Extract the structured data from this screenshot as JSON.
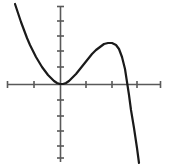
{
  "figure": {
    "title": "",
    "background_color": "#ffffff"
  },
  "chart_data": {
    "type": "line",
    "title": "",
    "subtitle": "",
    "xlabel": "",
    "ylabel": "",
    "grid": false,
    "legend": null,
    "axes": {
      "x_axis": {
        "color": "#595959",
        "line_width": 1.6,
        "pixel_y": 84,
        "pixel_x_start": 7,
        "pixel_x_end": 161,
        "range": [
          -2.05,
          3.9
        ],
        "tick_values": [
          -1,
          1,
          2,
          3
        ],
        "tick_labels": [
          "",
          "",
          "",
          ""
        ],
        "tick_pixels": [
          34,
          86,
          112,
          137
        ],
        "tick_length": 7
      },
      "y_axis": {
        "color": "#595959",
        "line_width": 1.6,
        "pixel_x": 60,
        "pixel_y_start": 6,
        "pixel_y_end": 162,
        "range": [
          -5.2,
          5.2
        ],
        "tick_values": [
          4,
          3,
          2,
          1,
          -1,
          -2,
          -3,
          -4,
          -5
        ],
        "tick_labels": [
          "",
          "",
          "",
          "",
          "",
          "",
          "",
          "",
          ""
        ],
        "tick_pixels": [
          21,
          36,
          51,
          67,
          100,
          116,
          131,
          146,
          158
        ],
        "tick_length": 7
      }
    },
    "curve": {
      "name": "polynomial-curve",
      "color": "#1a1a1a",
      "line_width": 2.2,
      "style": "solid",
      "features": {
        "tangential_minimum": {
          "x": 0,
          "y": 0,
          "pixel": [
            60,
            84
          ]
        },
        "local_maximum": {
          "x": 1.95,
          "y": 1.38,
          "pixel": [
            111,
            43
          ]
        },
        "x_intercept_right": {
          "x": 2.55,
          "y": 0,
          "pixel": [
            127,
            84
          ]
        }
      },
      "points_pixel": [
        [
          15,
          4
        ],
        [
          18,
          13
        ],
        [
          21,
          22
        ],
        [
          24,
          30
        ],
        [
          27,
          38
        ],
        [
          30,
          45
        ],
        [
          33,
          51
        ],
        [
          36,
          57
        ],
        [
          39,
          62
        ],
        [
          42,
          67
        ],
        [
          45,
          71
        ],
        [
          48,
          75
        ],
        [
          51,
          78
        ],
        [
          54,
          81
        ],
        [
          57,
          83
        ],
        [
          60,
          84
        ],
        [
          63,
          84
        ],
        [
          66,
          83
        ],
        [
          69,
          81
        ],
        [
          72,
          78
        ],
        [
          76,
          74
        ],
        [
          80,
          69
        ],
        [
          84,
          64
        ],
        [
          88,
          59
        ],
        [
          92,
          54
        ],
        [
          96,
          50
        ],
        [
          100,
          47
        ],
        [
          104,
          44
        ],
        [
          108,
          43
        ],
        [
          112,
          43
        ],
        [
          116,
          45
        ],
        [
          119,
          49
        ],
        [
          122,
          57
        ],
        [
          125,
          69
        ],
        [
          127,
          82
        ],
        [
          129,
          95
        ],
        [
          131,
          110
        ],
        [
          134,
          128
        ],
        [
          137,
          148
        ],
        [
          139,
          163
        ]
      ]
    }
  },
  "icons": {
    "curve": "curve-icon",
    "axis": "axis-icon"
  }
}
